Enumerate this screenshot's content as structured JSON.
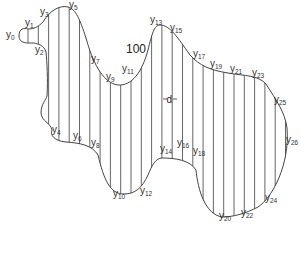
{
  "diagram": {
    "type": "area-by-ordinates",
    "region_label": "100",
    "interval_label": "d",
    "ordinate_count": 27,
    "colors": {
      "outline": "#444444",
      "ordinates": "#555555",
      "text": "#333333",
      "background": "#ffffff"
    },
    "labels": [
      {
        "base": "y",
        "sub": "0"
      },
      {
        "base": "y",
        "sub": "1"
      },
      {
        "base": "y",
        "sub": "2"
      },
      {
        "base": "y",
        "sub": "3"
      },
      {
        "base": "y",
        "sub": "4"
      },
      {
        "base": "y",
        "sub": "5"
      },
      {
        "base": "y",
        "sub": "6"
      },
      {
        "base": "y",
        "sub": "7"
      },
      {
        "base": "y",
        "sub": "8"
      },
      {
        "base": "y",
        "sub": "9"
      },
      {
        "base": "y",
        "sub": "10"
      },
      {
        "base": "y",
        "sub": "11"
      },
      {
        "base": "y",
        "sub": "12"
      },
      {
        "base": "y",
        "sub": "13"
      },
      {
        "base": "y",
        "sub": "14"
      },
      {
        "base": "y",
        "sub": "15"
      },
      {
        "base": "y",
        "sub": "16"
      },
      {
        "base": "y",
        "sub": "17"
      },
      {
        "base": "y",
        "sub": "18"
      },
      {
        "base": "y",
        "sub": "19"
      },
      {
        "base": "y",
        "sub": "20"
      },
      {
        "base": "y",
        "sub": "21"
      },
      {
        "base": "y",
        "sub": "22"
      },
      {
        "base": "y",
        "sub": "23"
      },
      {
        "base": "y",
        "sub": "24"
      },
      {
        "base": "y",
        "sub": "25"
      },
      {
        "base": "y",
        "sub": "26"
      }
    ]
  }
}
